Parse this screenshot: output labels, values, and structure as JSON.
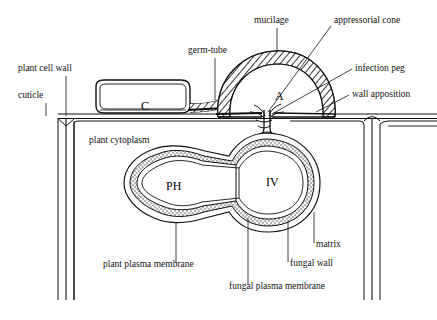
{
  "figure": {
    "width": 437,
    "height": 320,
    "background": "#ffffff",
    "ink": "#111111"
  },
  "structure_labels": [
    {
      "id": "conidium",
      "text": "C",
      "x": 141,
      "y": 100
    },
    {
      "id": "appressorium",
      "text": "A",
      "x": 275,
      "y": 90
    },
    {
      "id": "primary-haustorium",
      "text": "PH",
      "x": 176,
      "y": 186
    },
    {
      "id": "infection-vesicle",
      "text": "IV",
      "x": 276,
      "y": 182
    }
  ],
  "callout_labels": [
    {
      "id": "plant-cell-wall",
      "text": "plant cell wall",
      "x": 18,
      "y": 70,
      "align": "left"
    },
    {
      "id": "cuticle",
      "text": "cuticle",
      "x": 18,
      "y": 97,
      "align": "left"
    },
    {
      "id": "germ-tube",
      "text": "germ-tube",
      "x": 188,
      "y": 52,
      "align": "left"
    },
    {
      "id": "mucilage",
      "text": "mucilage",
      "x": 254,
      "y": 20,
      "align": "left"
    },
    {
      "id": "appressorial-cone",
      "text": "appressorial cone",
      "x": 330,
      "y": 20,
      "align": "left"
    },
    {
      "id": "infection-peg",
      "text": "infection peg",
      "x": 353,
      "y": 70,
      "align": "left"
    },
    {
      "id": "wall-apposition",
      "text": "wall apposition",
      "x": 350,
      "y": 96,
      "align": "left"
    },
    {
      "id": "plant-cytoplasm",
      "text": "plant cytoplasm",
      "x": 89,
      "y": 142,
      "align": "left"
    },
    {
      "id": "matrix",
      "text": "matrix",
      "x": 313,
      "y": 246,
      "align": "left"
    },
    {
      "id": "fungal-wall",
      "text": "fungal wall",
      "x": 288,
      "y": 265,
      "align": "left"
    },
    {
      "id": "plant-plasma-membrane",
      "text": "plant plasma membrane",
      "x": 103,
      "y": 266,
      "align": "left"
    },
    {
      "id": "fungal-plasma-membrane",
      "text": "fungal plasma membrane",
      "x": 229,
      "y": 288,
      "align": "left"
    }
  ],
  "colors": {
    "line": "#111111",
    "hatch": "#1a1a1a",
    "matrix_fill": "#b8b8b8",
    "wall_fill": "#ffffff"
  }
}
